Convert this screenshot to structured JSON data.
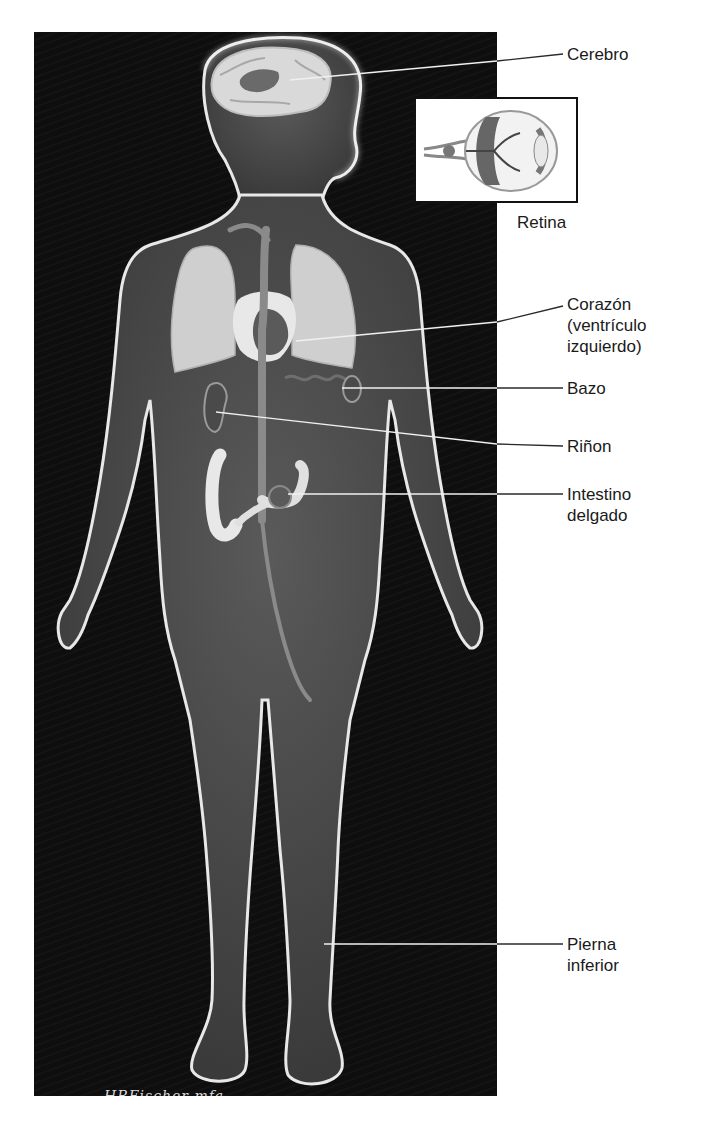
{
  "figure": {
    "background_color": "#0e0e0e",
    "body_glow_color": "#e8e8e8",
    "label_color": "#1a1a1a",
    "leader_line_color": "#f0f0f0"
  },
  "labels": [
    {
      "id": "cerebro",
      "text": "Cerebro"
    },
    {
      "id": "retina",
      "text": "Retina"
    },
    {
      "id": "corazon",
      "text": "Corazón\n(ventrículo\nizquierdo)"
    },
    {
      "id": "bazo",
      "text": "Bazo"
    },
    {
      "id": "rinon",
      "text": "Riñon"
    },
    {
      "id": "intestino",
      "text": "Intestino\ndelgado"
    },
    {
      "id": "pierna",
      "text": "Pierna\ninferior"
    }
  ],
  "signature": {
    "name": "HRFischer mfa",
    "year": "2014"
  }
}
